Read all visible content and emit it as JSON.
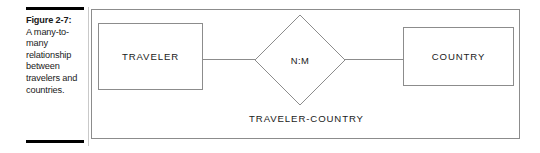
{
  "caption": {
    "figure_label": "Figure 2-7:",
    "description": "A many-to-many relationship between travelers and countries."
  },
  "figure": {
    "entities": [
      {
        "id": "traveler",
        "label": "TRAVELER"
      },
      {
        "id": "country",
        "label": "COUNTRY"
      }
    ],
    "relationship": {
      "cardinality": "N:M",
      "name": "TRAVELER-COUNTRY"
    }
  },
  "colors": {
    "rule": "#000000",
    "line": "#8c8c8c",
    "text": "#1a1a1a",
    "background": "#ffffff"
  }
}
